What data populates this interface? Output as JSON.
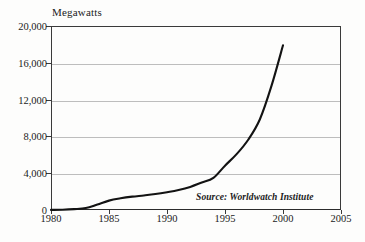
{
  "chart_data": {
    "type": "line",
    "title": "Megawatts",
    "xlabel": "",
    "ylabel": "Megawatts",
    "xlim": [
      1980,
      2005
    ],
    "ylim": [
      0,
      20000
    ],
    "grid": true,
    "legend": false,
    "annotations": [
      {
        "name": "source",
        "text": "Source: Worldwatch Institute"
      }
    ],
    "xticks": [
      "1980",
      "1985",
      "1990",
      "1995",
      "2000",
      "2005"
    ],
    "xtick_values": [
      1980,
      1985,
      1990,
      1995,
      2000,
      2005
    ],
    "yticks": [
      "0",
      "4,000",
      "8,000",
      "12,000",
      "16,000",
      "20,000"
    ],
    "ytick_values": [
      0,
      4000,
      8000,
      12000,
      16000,
      20000
    ],
    "series": [
      {
        "name": "World Wind Energy Generating Capacity",
        "x": [
          1980,
          1981,
          1982,
          1983,
          1984,
          1985,
          1986,
          1987,
          1988,
          1989,
          1990,
          1991,
          1992,
          1993,
          1994,
          1995,
          1996,
          1997,
          1998,
          1999,
          2000
        ],
        "values": [
          10,
          25,
          90,
          210,
          600,
          1020,
          1270,
          1450,
          1580,
          1730,
          1930,
          2170,
          2510,
          2990,
          3490,
          4820,
          6070,
          7640,
          9840,
          13460,
          17900
        ]
      }
    ]
  },
  "axis_title": "Megawatts",
  "source_note": "Source: Worldwatch Institute"
}
